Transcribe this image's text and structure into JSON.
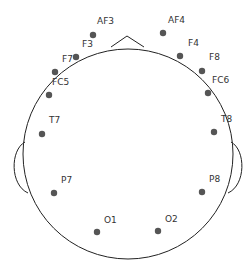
{
  "diagram": {
    "title": "",
    "type": "eeg-topographic-head-map",
    "colors": {
      "outline": "#222222",
      "electrode": "#555555",
      "label": "#333333",
      "background": "#ffffff"
    },
    "head": {
      "cx": 128,
      "cy": 154,
      "r": 105
    },
    "nose": {
      "left_x": 111,
      "right_x": 144,
      "base_y": 47,
      "tip_x": 127,
      "tip_y": 36
    },
    "ears": {
      "left": {
        "top_y": 142,
        "bottom_y": 193,
        "attach_x": 24,
        "outer_x": 16
      },
      "right": {
        "top_y": 142,
        "bottom_y": 193,
        "attach_x": 232,
        "outer_x": 240
      }
    },
    "electrodes": [
      {
        "name": "AF3",
        "x": 93,
        "y": 35,
        "lx": 97,
        "ly": 24
      },
      {
        "name": "F3",
        "x": 76,
        "y": 57,
        "lx": 82,
        "ly": 47
      },
      {
        "name": "F7",
        "x": 55,
        "y": 72,
        "lx": 62,
        "ly": 62
      },
      {
        "name": "FC5",
        "x": 49,
        "y": 95,
        "lx": 52,
        "ly": 85
      },
      {
        "name": "T7",
        "x": 42,
        "y": 134,
        "lx": 49,
        "ly": 123
      },
      {
        "name": "P7",
        "x": 54,
        "y": 193,
        "lx": 61,
        "ly": 183
      },
      {
        "name": "O1",
        "x": 97,
        "y": 232,
        "lx": 104,
        "ly": 223
      },
      {
        "name": "O2",
        "x": 158,
        "y": 231,
        "lx": 165,
        "ly": 222
      },
      {
        "name": "P8",
        "x": 202,
        "y": 192,
        "lx": 209,
        "ly": 182
      },
      {
        "name": "T8",
        "x": 214,
        "y": 132,
        "lx": 221,
        "ly": 122
      },
      {
        "name": "FC6",
        "x": 208,
        "y": 93,
        "lx": 212,
        "ly": 83
      },
      {
        "name": "F8",
        "x": 202,
        "y": 71,
        "lx": 209,
        "ly": 60
      },
      {
        "name": "F4",
        "x": 180,
        "y": 56,
        "lx": 188,
        "ly": 46
      },
      {
        "name": "AF4",
        "x": 163,
        "y": 33,
        "lx": 168,
        "ly": 23
      }
    ]
  }
}
